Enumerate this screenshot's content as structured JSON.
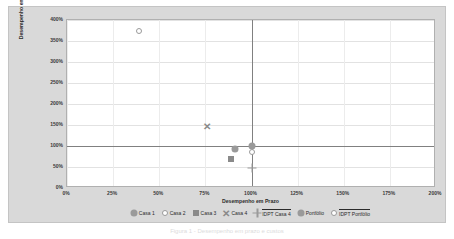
{
  "chart_data": {
    "type": "scatter",
    "title": "",
    "xlabel": "Desempenho em Prazo",
    "ylabel": "Desempenho em Custos",
    "xlim": [
      0,
      200
    ],
    "ylim": [
      0,
      400
    ],
    "xticks": [
      "0%",
      "25%",
      "50%",
      "75%",
      "100%",
      "125%",
      "150%",
      "175%",
      "200%"
    ],
    "xtick_values": [
      0,
      25,
      50,
      75,
      100,
      125,
      150,
      175,
      200
    ],
    "yticks": [
      "0%",
      "50%",
      "100%",
      "150%",
      "200%",
      "250%",
      "300%",
      "350%",
      "400%"
    ],
    "ytick_values": [
      0,
      50,
      100,
      150,
      200,
      250,
      300,
      350,
      400
    ],
    "grid": true,
    "legend_position": "bottom",
    "reference_lines": [
      {
        "axis": "y",
        "value": 100,
        "color": "#808080"
      },
      {
        "axis": "x",
        "value": 100,
        "color": "#808080"
      }
    ],
    "series": [
      {
        "name": "Casa 1",
        "marker": "circle-filled",
        "color": "#9a9a9a",
        "points": [
          {
            "x": 100,
            "y": 100
          }
        ]
      },
      {
        "name": "Casa 2",
        "marker": "circle-open",
        "color": "#9a9a9a",
        "points": [
          {
            "x": 39,
            "y": 375
          }
        ]
      },
      {
        "name": "Casa 3",
        "marker": "square-filled",
        "color": "#8a8a8a",
        "points": [
          {
            "x": 89,
            "y": 70
          }
        ]
      },
      {
        "name": "Casa 4",
        "marker": "cross",
        "color": "#8a8a8a",
        "points": [
          {
            "x": 76,
            "y": 147
          }
        ]
      },
      {
        "name": "IDPT Casa 4",
        "marker": "cross-thin",
        "color": "#9a9a9a",
        "overline": true,
        "points": [
          {
            "x": 100,
            "y": 48
          }
        ]
      },
      {
        "name": "Portfólio",
        "marker": "circle-filled",
        "color": "#9a9a9a",
        "points": [
          {
            "x": 91,
            "y": 93
          }
        ]
      },
      {
        "name": "IDPT Portfólio",
        "marker": "circle-open",
        "color": "#9a9a9a",
        "overline": true,
        "points": [
          {
            "x": 100,
            "y": 85
          }
        ]
      }
    ]
  },
  "caption": "Figura 1 - Desempenho em prazo e custos"
}
